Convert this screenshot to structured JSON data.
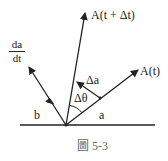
{
  "figure": {
    "caption": "圖 5-3",
    "vectors": {
      "a_t_plus_dt": {
        "label": "A(t + Δt)"
      },
      "a_t": {
        "label": "A(t)"
      },
      "da_dt": {
        "numerator": "da",
        "denominator": "dt"
      }
    },
    "labels": {
      "b": "b",
      "a": "a",
      "delta_a": "Δa",
      "delta_theta": "Δθ"
    },
    "colors": {
      "ink": "#222222",
      "caption": "#666666",
      "background": "#ffffff"
    }
  }
}
